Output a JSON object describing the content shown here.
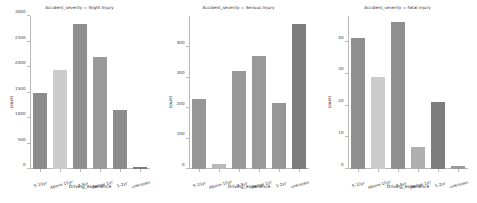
{
  "figure": {
    "background": "#ffffff",
    "axis_color": "#b9b9b9",
    "text_color": "#3a3a3a"
  },
  "axis_names": {
    "x": "Driving_experience",
    "y": "count"
  },
  "palette": {
    "dark_gray": "#8c8c8c",
    "light_gray": "#cccccc",
    "mid_gray": "#9a9a9a",
    "darker_gray": "#7a7a7a"
  },
  "chart_data": [
    {
      "type": "bar",
      "title": "Accident_severity = Slight Injury",
      "xlabel": "Driving_experience",
      "ylabel": "count",
      "categories": [
        "5-10yr",
        "Above 10yr",
        "2-5yr",
        "Below 1yr",
        "1-2yr",
        "unknown"
      ],
      "values": [
        1500,
        1950,
        2850,
        2200,
        1150,
        30
      ],
      "colors": [
        "#8c8c8c",
        "#cccccc",
        "#8f8f8f",
        "#9a9a9a",
        "#8c8c8c",
        "#7a7a7a"
      ],
      "ylim": [
        0,
        3000
      ],
      "yticks": [
        0,
        500,
        1000,
        1500,
        2000,
        2500,
        3000
      ],
      "ytick_labels": [
        "0",
        "500",
        "1000",
        "1500",
        "2000",
        "2500",
        "3000"
      ],
      "grid": false,
      "legend": "none"
    },
    {
      "type": "bar",
      "title": "Accident_severity = Serious Injury",
      "xlabel": "Driving_experience",
      "ylabel": "count",
      "categories": [
        "5-10yr",
        "Above 10yr",
        "2-5yr",
        "Below 1yr",
        "1-2yr",
        "unknown"
      ],
      "values": [
        230,
        18,
        320,
        370,
        215,
        475
      ],
      "colors": [
        "#979797",
        "#b9b9b9",
        "#999999",
        "#9a9a9a",
        "#969696",
        "#7d7d7d"
      ],
      "ylim": [
        0,
        500
      ],
      "yticks": [
        0,
        100,
        200,
        300,
        400
      ],
      "ytick_labels": [
        "0",
        "100",
        "200",
        "300",
        "400"
      ],
      "grid": false,
      "legend": "none"
    },
    {
      "type": "bar",
      "title": "Accident_severity = Fatal injury",
      "xlabel": "Driving_experience",
      "ylabel": "count",
      "categories": [
        "5-10yr",
        "Above 10yr",
        "2-5yr",
        "Below 1yr",
        "1-2yr",
        "unknown"
      ],
      "values": [
        41,
        29,
        46,
        7,
        21,
        1
      ],
      "colors": [
        "#8f8f8f",
        "#cccccc",
        "#8f8f8f",
        "#b0b0b0",
        "#7d7d7d",
        "#9a9a9a"
      ],
      "ylim": [
        0,
        48
      ],
      "yticks": [
        0,
        10,
        20,
        30,
        40
      ],
      "ytick_labels": [
        "0",
        "10",
        "20",
        "30",
        "40"
      ],
      "grid": false,
      "legend": "none"
    }
  ]
}
